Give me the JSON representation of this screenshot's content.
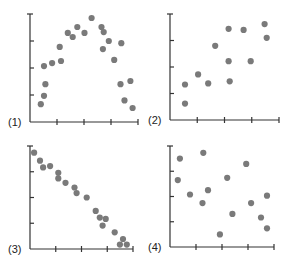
{
  "figure": {
    "colors": {
      "axis": "#333333",
      "dot": "#7a7a7a",
      "label": "#222222",
      "background": "#ffffff"
    }
  },
  "chart_data": [
    {
      "type": "scatter",
      "label": "(1)",
      "title": "",
      "xlabel": "",
      "ylabel": "",
      "xlim": [
        0,
        4
      ],
      "ylim": [
        0,
        4.0
      ],
      "x_ticks": 4,
      "y_ticks": 4,
      "grid": false,
      "tick_labels": "none",
      "pattern": "inverted U (curvilinear)",
      "points": [
        [
          0.4,
          0.66
        ],
        [
          0.52,
          0.97
        ],
        [
          0.57,
          1.4
        ],
        [
          0.52,
          2.07
        ],
        [
          0.82,
          2.18
        ],
        [
          1.15,
          2.26
        ],
        [
          1.1,
          2.78
        ],
        [
          1.4,
          3.3
        ],
        [
          1.58,
          3.15
        ],
        [
          1.75,
          3.52
        ],
        [
          2.02,
          3.3
        ],
        [
          2.28,
          3.85
        ],
        [
          2.65,
          3.52
        ],
        [
          2.73,
          3.33
        ],
        [
          2.7,
          2.7
        ],
        [
          2.92,
          3.0
        ],
        [
          3.12,
          2.3
        ],
        [
          3.38,
          2.92
        ],
        [
          3.35,
          1.4
        ],
        [
          3.5,
          0.8
        ],
        [
          3.72,
          1.52
        ],
        [
          3.8,
          0.52
        ]
      ]
    },
    {
      "type": "scatter",
      "label": "(2)",
      "title": "",
      "xlabel": "",
      "ylabel": "",
      "xlim": [
        0,
        4
      ],
      "ylim": [
        0,
        4.0
      ],
      "x_ticks": 4,
      "y_ticks": 4,
      "grid": false,
      "tick_labels": "none",
      "pattern": "weak positive linear",
      "points": [
        [
          0.55,
          0.62
        ],
        [
          0.55,
          1.34
        ],
        [
          1.03,
          1.72
        ],
        [
          1.4,
          1.38
        ],
        [
          1.66,
          2.8
        ],
        [
          2.15,
          3.44
        ],
        [
          2.15,
          2.22
        ],
        [
          2.19,
          1.46
        ],
        [
          2.7,
          3.4
        ],
        [
          2.96,
          2.22
        ],
        [
          3.47,
          3.62
        ],
        [
          3.55,
          3.1
        ]
      ]
    },
    {
      "type": "scatter",
      "label": "(3)",
      "title": "",
      "xlabel": "",
      "ylabel": "",
      "xlim": [
        0,
        4
      ],
      "ylim": [
        0,
        4.0
      ],
      "x_ticks": 4,
      "y_ticks": 4,
      "grid": false,
      "tick_labels": "none",
      "pattern": "strong negative linear",
      "points": [
        [
          0.16,
          3.74
        ],
        [
          0.39,
          3.43
        ],
        [
          0.51,
          3.17
        ],
        [
          0.78,
          3.22
        ],
        [
          1.1,
          2.96
        ],
        [
          1.1,
          2.74
        ],
        [
          1.38,
          2.57
        ],
        [
          1.73,
          2.39
        ],
        [
          1.81,
          2.17
        ],
        [
          2.2,
          2.0
        ],
        [
          2.55,
          1.48
        ],
        [
          2.71,
          1.22
        ],
        [
          2.94,
          1.17
        ],
        [
          2.82,
          0.91
        ],
        [
          3.29,
          0.65
        ],
        [
          3.49,
          0.17
        ],
        [
          3.61,
          0.39
        ],
        [
          3.76,
          0.17
        ]
      ]
    },
    {
      "type": "scatter",
      "label": "(4)",
      "title": "",
      "xlabel": "",
      "ylabel": "",
      "xlim": [
        0,
        4
      ],
      "ylim": [
        0,
        4.0
      ],
      "x_ticks": 4,
      "y_ticks": 4,
      "grid": false,
      "tick_labels": "none",
      "pattern": "no correlation",
      "points": [
        [
          0.38,
          3.5
        ],
        [
          0.3,
          2.65
        ],
        [
          0.77,
          2.08
        ],
        [
          1.28,
          3.73
        ],
        [
          1.25,
          1.74
        ],
        [
          1.46,
          2.25
        ],
        [
          1.92,
          0.5
        ],
        [
          2.2,
          2.74
        ],
        [
          2.4,
          1.31
        ],
        [
          2.93,
          3.29
        ],
        [
          3.12,
          1.74
        ],
        [
          3.5,
          1.17
        ],
        [
          3.73,
          0.74
        ],
        [
          3.73,
          2.03
        ]
      ]
    }
  ]
}
